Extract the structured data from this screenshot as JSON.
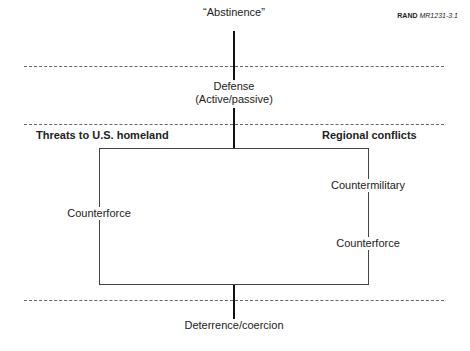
{
  "source": {
    "org": "RAND",
    "id": "MR1231-3.1"
  },
  "diagram": {
    "top_label": "“Abstinence”",
    "middle_label_line1": "Defense",
    "middle_label_line2": "(Active/passive)",
    "bottom_label": "Deterrence/coercion",
    "left_heading": "Threats to U.S. homeland",
    "right_heading": "Regional conflicts",
    "left_branch": [
      "Counterforce"
    ],
    "right_branch": [
      "Countermilitary",
      "Counterforce"
    ]
  },
  "colors": {
    "spine": "#111111",
    "box": "#444444",
    "dashes": "#666666"
  }
}
